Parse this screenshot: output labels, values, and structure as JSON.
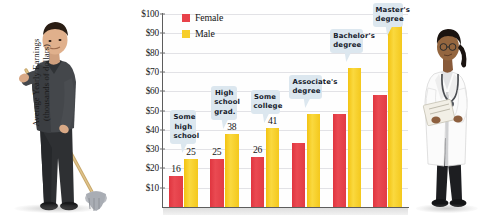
{
  "chart_data": {
    "type": "bar",
    "title": "",
    "xlabel": "",
    "ylabel": "Average Yearly Earnings (thousands of dollars)",
    "ylabel_line1": "Average Yearly Earnings",
    "ylabel_line2": "(thousands of dollars)",
    "ylim": [
      0,
      100
    ],
    "yticks": [
      "$10",
      "$20",
      "$30",
      "$40",
      "$50",
      "$60",
      "$70",
      "$80",
      "$90",
      "$100"
    ],
    "ytick_values": [
      10,
      20,
      30,
      40,
      50,
      60,
      70,
      80,
      90,
      100
    ],
    "grid": true,
    "legend_position": "top-left",
    "categories": [
      "Some high school",
      "High school grad.",
      "Some college",
      "Associate's degree",
      "Bachelor's degree",
      "Master's degree"
    ],
    "series": [
      {
        "name": "Female",
        "color": "#e8424a",
        "values": [
          16,
          25,
          26,
          33,
          48,
          58
        ],
        "labels": [
          "16",
          "25",
          "26",
          "",
          "",
          ""
        ]
      },
      {
        "name": "Male",
        "color": "#f7ce2b",
        "values": [
          25,
          38,
          41,
          48,
          72,
          97
        ],
        "labels": [
          "25",
          "38",
          "41",
          "",
          "",
          ""
        ]
      }
    ]
  },
  "legend": {
    "items": [
      {
        "label": "Female",
        "color": "#e8424a"
      },
      {
        "label": "Male",
        "color": "#f7ce2b"
      }
    ]
  },
  "callouts": [
    {
      "lines": [
        "Some",
        "high",
        "school"
      ]
    },
    {
      "lines": [
        "High",
        "school",
        "grad."
      ]
    },
    {
      "lines": [
        "Some",
        "college"
      ]
    },
    {
      "lines": [
        "Associate's",
        "degree"
      ]
    },
    {
      "lines": [
        "Bachelor's",
        "degree"
      ]
    },
    {
      "lines": [
        "Master's",
        "degree"
      ]
    }
  ],
  "photos": {
    "left": {
      "alt": "janitor mopping floor"
    },
    "right": {
      "alt": "female doctor with clipboard and stethoscope"
    }
  }
}
